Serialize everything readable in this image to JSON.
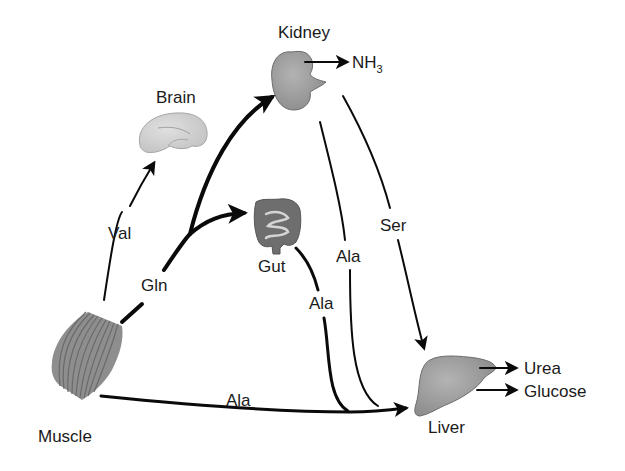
{
  "diagram": {
    "type": "metabolic-flow",
    "organs": {
      "kidney": "Kidney",
      "brain": "Brain",
      "gut": "Gut",
      "muscle": "Muscle",
      "liver": "Liver"
    },
    "outputs": {
      "nh3_base": "NH",
      "nh3_sub": "3",
      "urea": "Urea",
      "glucose": "Glucose"
    },
    "edges": [
      {
        "from": "Muscle",
        "to": "Brain",
        "label": "Val"
      },
      {
        "from": "Muscle",
        "to": "Kidney",
        "label": "Gln"
      },
      {
        "from": "Muscle",
        "to": "Gut",
        "label": "Gln"
      },
      {
        "from": "Muscle",
        "to": "Liver",
        "label": "Ala"
      },
      {
        "from": "Gut",
        "to": "Liver",
        "label": "Ala"
      },
      {
        "from": "Kidney",
        "to": "Liver",
        "label": "Ala"
      },
      {
        "from": "Kidney",
        "to": "Liver",
        "label": "Ser"
      },
      {
        "from": "Kidney",
        "to": "out",
        "label": "NH3"
      },
      {
        "from": "Liver",
        "to": "out",
        "label": "Urea"
      },
      {
        "from": "Liver",
        "to": "out",
        "label": "Glucose"
      }
    ],
    "labels": {
      "val": "Val",
      "gln": "Gln",
      "ser": "Ser",
      "ala_kidney": "Ala",
      "ala_gut": "Ala",
      "ala_muscle": "Ala"
    },
    "colors": {
      "organ_fill": "#9a9a9a",
      "brain_fill": "#cfcfcf",
      "gut_fill": "#6e6e6e",
      "arrow": "#0a0a0a"
    }
  }
}
